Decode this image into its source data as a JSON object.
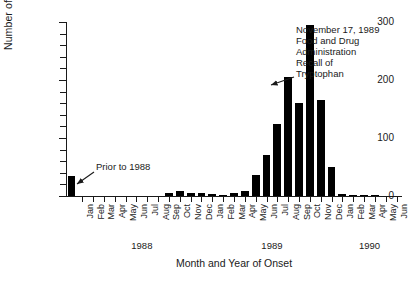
{
  "chart_data": {
    "type": "bar",
    "title": "",
    "xlabel": "Month and Year of Onset",
    "ylabel": "Number of Cases",
    "ylim": [
      0,
      300
    ],
    "ytick_values": [
      0,
      100,
      200,
      300
    ],
    "ytick_labels": [
      "0",
      "100",
      "200",
      "300"
    ],
    "yminor_step": 20,
    "grid": false,
    "legend": "none",
    "bar_color": "#000000",
    "groups": [
      {
        "year_label": "",
        "start_index": 0,
        "count": 1
      },
      {
        "year_label": "1988",
        "start_index": 1,
        "count": 12
      },
      {
        "year_label": "1989",
        "start_index": 13,
        "count": 12
      },
      {
        "year_label": "1990",
        "start_index": 25,
        "count": 6
      }
    ],
    "categories": [
      "Prior",
      "Jan",
      "Feb",
      "Mar",
      "Apr",
      "May",
      "Jun",
      "Jul",
      "Aug",
      "Sep",
      "Oct",
      "Nov",
      "Dec",
      "Jan",
      "Feb",
      "Mar",
      "Apr",
      "May",
      "Jun",
      "Jul",
      "Aug",
      "Sep",
      "Oct",
      "Nov",
      "Dec",
      "Jan",
      "Feb",
      "Mar",
      "Apr",
      "May",
      "Jun"
    ],
    "tick_labels": [
      "",
      "Jan",
      "Feb",
      "Mar",
      "Apr",
      "May",
      "Jun",
      "Jul",
      "Aug",
      "Sep",
      "Oct",
      "Nov",
      "Dec",
      "Jan",
      "Feb",
      "Mar",
      "Apr",
      "May",
      "Jun",
      "Jul",
      "Aug",
      "Sep",
      "Oct",
      "Nov",
      "Dec",
      "Jan",
      "Feb",
      "Mar",
      "Apr",
      "May",
      "Jun"
    ],
    "values": [
      35,
      0,
      0,
      0,
      0,
      0,
      0,
      0,
      0,
      6,
      8,
      6,
      5,
      4,
      2,
      6,
      8,
      36,
      70,
      125,
      205,
      160,
      295,
      165,
      50,
      3,
      2,
      1,
      1,
      0,
      0
    ]
  },
  "annotations": {
    "prior": {
      "text": "Prior to 1988",
      "target_bar_index": 0
    },
    "recall": {
      "text": "November 17, 1989\nFood and Drug\nAdministration\nRecall of\nTryptophan",
      "target_bar_index": 23
    }
  }
}
